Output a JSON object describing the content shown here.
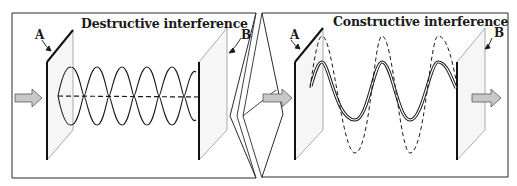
{
  "figure": {
    "left_panel": {
      "title": "Destructive interference",
      "label_first_plane": "A",
      "label_second_plane": "B",
      "wave_description": "two opposite-phase waves cancel (dashed resultant near zero)",
      "loops": 6
    },
    "right_panel": {
      "title": "Constructive interference",
      "label_first_plane": "A",
      "label_second_plane": "B",
      "wave_description": "two in-phase waves add (dashed resultant with larger amplitude)",
      "peaks": 3
    },
    "icons": {
      "input_arrow": "right-arrow",
      "output_arrow": "right-arrow"
    },
    "colors": {
      "line": "#1a1a1a",
      "arrow_fill": "#c8c8c8",
      "plane_fill": "#f4f4f4",
      "background": "#ffffff"
    }
  }
}
